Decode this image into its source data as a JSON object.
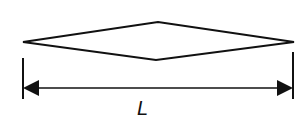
{
  "diagram": {
    "type": "dimensioned-shape",
    "shape": {
      "kind": "elongated-rhombus",
      "left_tip": [
        23,
        42
      ],
      "top_vertex": [
        158,
        22
      ],
      "right_tip": [
        294,
        42
      ],
      "bottom_vertex": [
        156,
        60
      ]
    },
    "dimension": {
      "label": "L",
      "meaning": "length",
      "line_y": 88,
      "x_start": 23,
      "x_end": 293,
      "left_extension": [
        23,
        58,
        99
      ],
      "right_extension": [
        293,
        52,
        99
      ]
    },
    "colors": {
      "stroke": "#111111",
      "background": "#ffffff"
    }
  }
}
